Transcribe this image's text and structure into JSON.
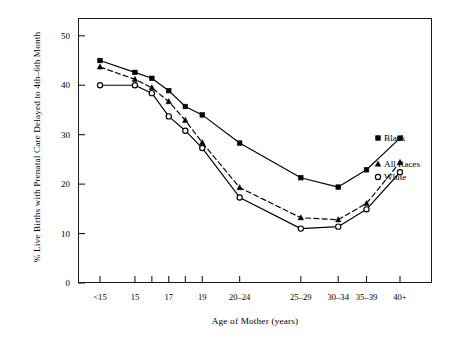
{
  "chart_data": {
    "type": "line",
    "title": "",
    "xlabel": "Age of Mother (years)",
    "ylabel": "% Live Births with Prenatal Care Delayed to 4th–6th Month",
    "categories": [
      "<15",
      "15",
      "16",
      "17",
      "18",
      "19",
      "20–24",
      "25–29",
      "30–34",
      "35–39",
      "40+"
    ],
    "xtick_labels": [
      "<15",
      "15",
      "",
      "17",
      "",
      "19",
      "20–24",
      "25–29",
      "30–34",
      "35–39",
      "40+"
    ],
    "ytick_labels": [
      "0",
      "10",
      "20",
      "30",
      "40",
      "50"
    ],
    "yticks": [
      0,
      10,
      20,
      30,
      40,
      50
    ],
    "ylim": [
      0,
      53.6
    ],
    "grid": false,
    "legend_position": "right-inside",
    "series": [
      {
        "name": "Black",
        "marker": "filled-square",
        "linestyle": "solid",
        "color": "#000000",
        "values": [
          45.0,
          42.6,
          41.4,
          38.9,
          35.7,
          34.0,
          28.3,
          21.3,
          19.4,
          22.9,
          29.3
        ]
      },
      {
        "name": "All Races",
        "marker": "filled-triangle",
        "linestyle": "dashed",
        "color": "#000000",
        "values": [
          43.7,
          41.2,
          39.5,
          36.7,
          32.9,
          28.4,
          19.3,
          13.2,
          12.8,
          16.1,
          24.4
        ]
      },
      {
        "name": "White",
        "marker": "open-circle",
        "linestyle": "solid",
        "color": "#000000",
        "values": [
          40.0,
          40.0,
          38.4,
          33.7,
          30.8,
          27.3,
          17.3,
          11.0,
          11.4,
          14.9,
          22.4
        ]
      }
    ]
  },
  "legend": {
    "entries": [
      {
        "label": "Black",
        "marker": "filled-square"
      },
      {
        "label": "All Races",
        "marker": "filled-triangle"
      },
      {
        "label": "White",
        "marker": "open-circle"
      }
    ]
  }
}
